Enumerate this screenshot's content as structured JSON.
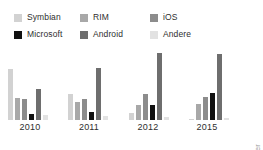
{
  "legend": {
    "items": [
      {
        "label": "Symbian",
        "color": "#d2d2d2"
      },
      {
        "label": "RIM",
        "color": "#a8a8a8"
      },
      {
        "label": "iOS",
        "color": "#8c8c8c"
      },
      {
        "label": "Microsoft",
        "color": "#111111"
      },
      {
        "label": "Android",
        "color": "#6e6e6e"
      },
      {
        "label": "Andere",
        "color": "#e2e2e2"
      }
    ]
  },
  "source": {
    "text": "Quelle: Gartner"
  },
  "chart_data": {
    "type": "bar",
    "title": "",
    "subtitle": "",
    "xlabel": "",
    "ylabel": "",
    "grid": false,
    "legend_position": "top",
    "categories": [
      "2010",
      "2011",
      "2012",
      "2015"
    ],
    "ylim": [
      0,
      50
    ],
    "series": [
      {
        "name": "Symbian",
        "color": "#d2d2d2",
        "values": [
          37.6,
          19.2,
          5.2,
          0.1
        ]
      },
      {
        "name": "RIM",
        "color": "#a8a8a8",
        "values": [
          16.0,
          13.4,
          11.1,
          11.7
        ]
      },
      {
        "name": "iOS",
        "color": "#8c8c8c",
        "values": [
          15.7,
          15.7,
          18.9,
          17.2
        ]
      },
      {
        "name": "Microsoft",
        "color": "#111111",
        "values": [
          4.2,
          5.6,
          11.0,
          19.5
        ]
      },
      {
        "name": "Android",
        "color": "#6e6e6e",
        "values": [
          22.7,
          38.5,
          49.2,
          48.8
        ]
      },
      {
        "name": "Andere",
        "color": "#e2e2e2",
        "values": [
          3.8,
          3.0,
          2.1,
          1.5
        ]
      }
    ]
  }
}
